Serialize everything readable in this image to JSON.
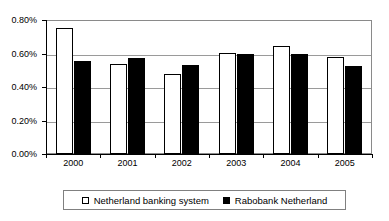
{
  "chart_data": {
    "type": "bar",
    "title": "",
    "xlabel": "",
    "ylabel": "",
    "categories": [
      "2000",
      "2001",
      "2002",
      "2003",
      "2004",
      "2005"
    ],
    "series": [
      {
        "name": "Netherland banking system",
        "color": "#ffffff",
        "values": [
          0.75,
          0.54,
          0.48,
          0.605,
          0.645,
          0.58
        ]
      },
      {
        "name": "Rabobank Netherland",
        "color": "#000000",
        "values": [
          0.555,
          0.572,
          0.53,
          0.6,
          0.597,
          0.528
        ]
      }
    ],
    "ylim": [
      0,
      0.8
    ],
    "ytick_values": [
      0.0,
      0.2,
      0.4,
      0.6,
      0.8
    ],
    "ytick_labels": [
      "0.00%",
      "0.20%",
      "0.40%",
      "0.60%",
      "0.80%"
    ],
    "grid": true,
    "legend_position": "bottom",
    "value_suffix": "%"
  },
  "legend": {
    "entries": [
      {
        "label": "Netherland banking system",
        "swatch": "open-square-icon"
      },
      {
        "label": "Rabobank Netherland",
        "swatch": "filled-square-icon"
      }
    ]
  },
  "colors": {
    "series_a": "#ffffff",
    "series_b": "#000000",
    "gridline": "#9a9a9a",
    "frame": "#8a8a8a",
    "axis": "#000000",
    "legend_border": "#808080",
    "background": "#ffffff"
  }
}
